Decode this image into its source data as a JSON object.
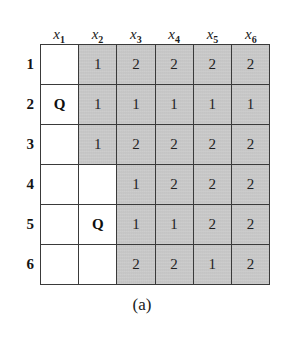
{
  "figure": {
    "caption": "(a)",
    "colors": {
      "shaded_cell": "#c9c9c9",
      "blank_cell": "#ffffff",
      "grid_line": "#3a3a3a",
      "text": "#1a1a1a",
      "background": "#ffffff"
    },
    "column_headers": [
      {
        "base": "x",
        "sub": "1"
      },
      {
        "base": "x",
        "sub": "2"
      },
      {
        "base": "x",
        "sub": "3"
      },
      {
        "base": "x",
        "sub": "4"
      },
      {
        "base": "x",
        "sub": "5"
      },
      {
        "base": "x",
        "sub": "6"
      }
    ],
    "row_labels": [
      "1",
      "2",
      "3",
      "4",
      "5",
      "6"
    ],
    "queen_symbol": "Q",
    "grid": [
      [
        {
          "value": "",
          "state": "blank"
        },
        {
          "value": "1",
          "state": "shaded"
        },
        {
          "value": "2",
          "state": "shaded"
        },
        {
          "value": "2",
          "state": "shaded"
        },
        {
          "value": "2",
          "state": "shaded"
        },
        {
          "value": "2",
          "state": "shaded"
        }
      ],
      [
        {
          "value": "Q",
          "state": "queen"
        },
        {
          "value": "1",
          "state": "shaded"
        },
        {
          "value": "1",
          "state": "shaded"
        },
        {
          "value": "1",
          "state": "shaded"
        },
        {
          "value": "1",
          "state": "shaded"
        },
        {
          "value": "1",
          "state": "shaded"
        }
      ],
      [
        {
          "value": "",
          "state": "blank"
        },
        {
          "value": "1",
          "state": "shaded"
        },
        {
          "value": "2",
          "state": "shaded"
        },
        {
          "value": "2",
          "state": "shaded"
        },
        {
          "value": "2",
          "state": "shaded"
        },
        {
          "value": "2",
          "state": "shaded"
        }
      ],
      [
        {
          "value": "",
          "state": "blank"
        },
        {
          "value": "",
          "state": "blank"
        },
        {
          "value": "1",
          "state": "shaded"
        },
        {
          "value": "2",
          "state": "shaded"
        },
        {
          "value": "2",
          "state": "shaded"
        },
        {
          "value": "2",
          "state": "shaded"
        }
      ],
      [
        {
          "value": "",
          "state": "blank"
        },
        {
          "value": "Q",
          "state": "queen"
        },
        {
          "value": "1",
          "state": "shaded"
        },
        {
          "value": "1",
          "state": "shaded"
        },
        {
          "value": "2",
          "state": "shaded"
        },
        {
          "value": "2",
          "state": "shaded"
        }
      ],
      [
        {
          "value": "",
          "state": "blank"
        },
        {
          "value": "",
          "state": "blank"
        },
        {
          "value": "2",
          "state": "shaded"
        },
        {
          "value": "2",
          "state": "shaded"
        },
        {
          "value": "1",
          "state": "shaded"
        },
        {
          "value": "2",
          "state": "shaded"
        }
      ]
    ]
  }
}
